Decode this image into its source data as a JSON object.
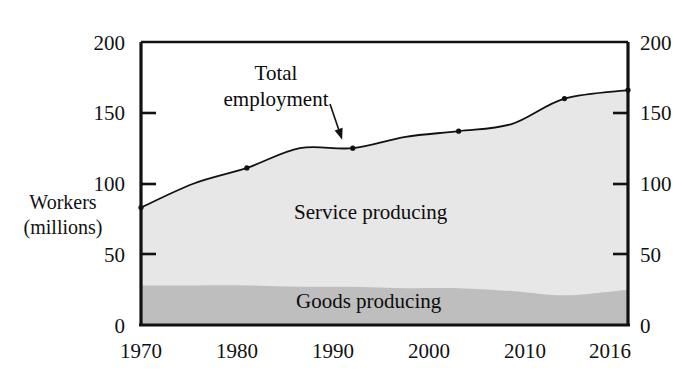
{
  "chart_data": {
    "type": "area",
    "title": "",
    "subtitle": "",
    "xlabel": "",
    "ylabel": "Workers (millions)",
    "ylabel_line1": "Workers",
    "ylabel_line2": "(millions)",
    "xlim": [
      1970,
      2016
    ],
    "ylim": [
      0,
      200
    ],
    "grid": false,
    "stacked": true,
    "legend_position": "inline-area-labels",
    "y_ticks": [
      0,
      50,
      100,
      150,
      200
    ],
    "y_tick_labels_left": [
      "0",
      "50",
      "100",
      "150",
      "200"
    ],
    "y_tick_labels_right": [
      "0",
      "50",
      "100",
      "150",
      "200"
    ],
    "x_ticks": [
      1970,
      1980,
      1990,
      2000,
      2010,
      2016
    ],
    "x_tick_labels": [
      "1970",
      "1980",
      "1990",
      "2000",
      "2010",
      "2016"
    ],
    "x": [
      1970,
      1975,
      1980,
      1985,
      1990,
      1995,
      2000,
      2005,
      2010,
      2016
    ],
    "series": [
      {
        "name": "Goods producing",
        "color": "#bebebe",
        "values": [
          28,
          28,
          28,
          27,
          27,
          26,
          26,
          24,
          21,
          25
        ]
      },
      {
        "name": "Service producing",
        "color": "#e7e7e7",
        "values": [
          55,
          72,
          83,
          98,
          98,
          107,
          111,
          118,
          139,
          141
        ]
      }
    ],
    "total_line": {
      "name": "Total employment",
      "color": "#111111",
      "values": [
        83,
        100,
        111,
        125,
        125,
        133,
        137,
        142,
        160,
        166
      ]
    },
    "markers": [
      {
        "x": 1970,
        "y": 83
      },
      {
        "x": 1980,
        "y": 111
      },
      {
        "x": 1990,
        "y": 125
      },
      {
        "x": 2000,
        "y": 137
      },
      {
        "x": 2010,
        "y": 160
      },
      {
        "x": 2016,
        "y": 166
      }
    ],
    "annotations": [
      {
        "name": "total-employment-callout",
        "text_line1": "Total",
        "text_line2": "employment",
        "text": "Total employment",
        "arrow_to_x": 1989,
        "arrow_to_y": 131
      },
      {
        "name": "service-area-label",
        "text": "Service producing"
      },
      {
        "name": "goods-area-label",
        "text": "Goods producing"
      }
    ]
  },
  "labels": {
    "total_employment_line1": "Total",
    "total_employment_line2": "employment",
    "service_producing": "Service producing",
    "goods_producing": "Goods producing",
    "workers_line1": "Workers",
    "workers_line2": "(millions)"
  },
  "axis": {
    "y_left": [
      "200",
      "150",
      "100",
      "50",
      "0"
    ],
    "y_right": [
      "200",
      "150",
      "100",
      "50",
      "0"
    ],
    "x": [
      "1970",
      "1980",
      "1990",
      "2000",
      "2010",
      "2016"
    ]
  },
  "colors": {
    "goods_fill": "#bebebe",
    "service_fill": "#e7e7e7",
    "frame": "#111111",
    "line": "#111111",
    "background": "#ffffff"
  }
}
